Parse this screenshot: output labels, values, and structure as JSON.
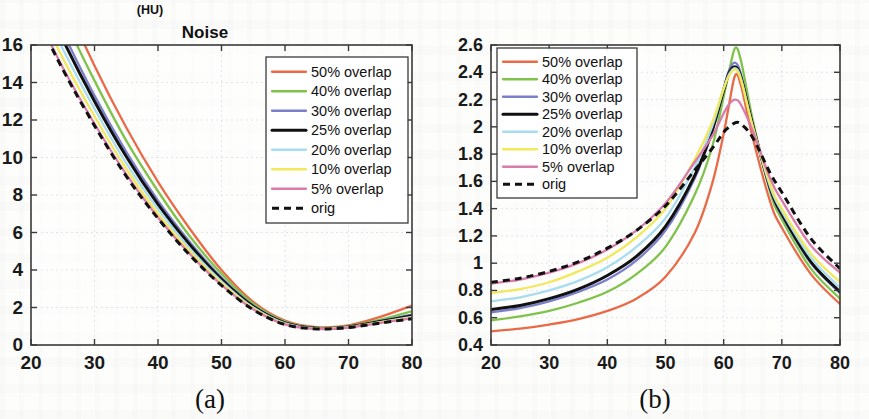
{
  "figure": {
    "unit_label": "(HU)",
    "title": "Noise",
    "caption_a": "(a)",
    "caption_b": "(b)"
  },
  "legend": {
    "entries": [
      {
        "label": "50% overlap",
        "color": "#ea6a47",
        "style": "solid"
      },
      {
        "label": "40% overlap",
        "color": "#7fc34a",
        "style": "solid"
      },
      {
        "label": "30% overlap",
        "color": "#7b7fcb",
        "style": "solid"
      },
      {
        "label": "25% overlap",
        "color": "#111111",
        "style": "solid-thick"
      },
      {
        "label": "20% overlap",
        "color": "#a8dcee",
        "style": "solid"
      },
      {
        "label": "10% overlap",
        "color": "#f2e85c",
        "style": "solid"
      },
      {
        "label": "5% overlap",
        "color": "#d97bab",
        "style": "solid"
      },
      {
        "label": "orig",
        "color": "#111111",
        "style": "dashed"
      }
    ]
  },
  "chart_data": [
    {
      "id": "a",
      "type": "line",
      "title": "Noise",
      "subtitle": "(HU)",
      "caption": "(a)",
      "xlabel": "",
      "ylabel": "(HU)",
      "xlim": [
        20,
        80
      ],
      "ylim": [
        0,
        16
      ],
      "xticks": [
        20,
        30,
        40,
        50,
        60,
        70,
        80
      ],
      "yticks": [
        0,
        2,
        4,
        6,
        8,
        10,
        12,
        14,
        16
      ],
      "xtick_labels": [
        "20",
        "30",
        "40",
        "50",
        "60",
        "70",
        "80"
      ],
      "ytick_labels": [
        "0",
        "2",
        "4",
        "6",
        "8",
        "10",
        "12",
        "14",
        "16"
      ],
      "grid": true,
      "legend_position": "upper-right",
      "x": [
        20,
        25,
        30,
        35,
        40,
        45,
        50,
        55,
        60,
        65,
        70,
        75,
        80
      ],
      "series": [
        {
          "name": "50% overlap",
          "color": "#ea6a47",
          "style": "solid",
          "values": [
            22.6,
            18.6,
            14.9,
            11.6,
            8.7,
            6.2,
            4.0,
            2.3,
            1.3,
            0.95,
            1.05,
            1.5,
            2.1
          ]
        },
        {
          "name": "40% overlap",
          "color": "#7fc34a",
          "style": "solid",
          "values": [
            21.5,
            17.6,
            14.1,
            10.9,
            8.2,
            5.8,
            3.8,
            2.2,
            1.25,
            0.92,
            1.0,
            1.35,
            1.8
          ]
        },
        {
          "name": "30% overlap",
          "color": "#7b7fcb",
          "style": "solid",
          "values": [
            20.4,
            16.7,
            13.3,
            10.3,
            7.7,
            5.5,
            3.6,
            2.1,
            1.2,
            0.9,
            0.98,
            1.28,
            1.62
          ]
        },
        {
          "name": "25% overlap",
          "color": "#111111",
          "style": "solid-thick",
          "values": [
            20.0,
            16.3,
            13.0,
            10.05,
            7.5,
            5.35,
            3.5,
            2.05,
            1.18,
            0.89,
            0.96,
            1.25,
            1.56
          ]
        },
        {
          "name": "20% overlap",
          "color": "#a8dcee",
          "style": "solid",
          "values": [
            19.4,
            15.8,
            12.6,
            9.7,
            7.25,
            5.15,
            3.4,
            2.0,
            1.15,
            0.88,
            0.95,
            1.22,
            1.5
          ]
        },
        {
          "name": "10% overlap",
          "color": "#f2e85c",
          "style": "solid",
          "values": [
            18.8,
            15.3,
            12.2,
            9.4,
            7.0,
            5.0,
            3.3,
            1.95,
            1.12,
            0.87,
            0.94,
            1.2,
            1.46
          ]
        },
        {
          "name": "5% overlap",
          "color": "#d97bab",
          "style": "solid",
          "values": [
            18.2,
            14.8,
            11.8,
            9.1,
            6.8,
            4.85,
            3.2,
            1.9,
            1.1,
            0.86,
            0.93,
            1.18,
            1.42
          ]
        },
        {
          "name": "orig",
          "color": "#111111",
          "style": "dashed",
          "values": [
            18.1,
            14.7,
            11.7,
            9.0,
            6.75,
            4.8,
            3.18,
            1.88,
            1.09,
            0.86,
            0.93,
            1.17,
            1.4
          ]
        }
      ]
    },
    {
      "id": "b",
      "type": "line",
      "caption": "(b)",
      "xlabel": "",
      "ylabel": "",
      "xlim": [
        20,
        80
      ],
      "ylim": [
        0.4,
        2.6
      ],
      "xticks": [
        20,
        30,
        40,
        50,
        60,
        70,
        80
      ],
      "yticks": [
        0.4,
        0.6,
        0.8,
        1,
        1.2,
        1.4,
        1.6,
        1.8,
        2,
        2.2,
        2.4,
        2.6
      ],
      "xtick_labels": [
        "20",
        "30",
        "40",
        "50",
        "60",
        "70",
        "80"
      ],
      "ytick_labels": [
        "0.4",
        "0.6",
        "0.8",
        "1",
        "1.2",
        "1.4",
        "1.6",
        "1.8",
        "2",
        "2.2",
        "2.4",
        "2.6"
      ],
      "grid": true,
      "legend_position": "upper-left",
      "x": [
        20,
        25,
        30,
        35,
        40,
        45,
        50,
        55,
        58,
        60,
        61,
        62,
        63,
        65,
        68,
        70,
        75,
        80
      ],
      "series": [
        {
          "name": "50% overlap",
          "color": "#ea6a47",
          "style": "solid",
          "values": [
            0.5,
            0.52,
            0.55,
            0.59,
            0.65,
            0.74,
            0.9,
            1.22,
            1.58,
            1.95,
            2.18,
            2.38,
            2.3,
            1.92,
            1.45,
            1.26,
            0.92,
            0.7
          ]
        },
        {
          "name": "40% overlap",
          "color": "#7fc34a",
          "style": "solid",
          "values": [
            0.58,
            0.61,
            0.65,
            0.71,
            0.79,
            0.92,
            1.12,
            1.5,
            1.85,
            2.22,
            2.42,
            2.58,
            2.48,
            2.05,
            1.52,
            1.32,
            0.96,
            0.74
          ]
        },
        {
          "name": "30% overlap",
          "color": "#7b7fcb",
          "style": "solid",
          "values": [
            0.64,
            0.67,
            0.72,
            0.79,
            0.88,
            1.02,
            1.24,
            1.62,
            1.96,
            2.28,
            2.42,
            2.47,
            2.38,
            2.02,
            1.54,
            1.35,
            1.0,
            0.78
          ]
        },
        {
          "name": "25% overlap",
          "color": "#111111",
          "style": "solid-thick",
          "values": [
            0.66,
            0.69,
            0.74,
            0.81,
            0.91,
            1.05,
            1.27,
            1.64,
            1.97,
            2.27,
            2.4,
            2.44,
            2.36,
            2.01,
            1.55,
            1.36,
            1.01,
            0.79
          ]
        },
        {
          "name": "20% overlap",
          "color": "#a8dcee",
          "style": "solid",
          "values": [
            0.72,
            0.75,
            0.8,
            0.87,
            0.97,
            1.12,
            1.33,
            1.7,
            2.0,
            2.28,
            2.39,
            2.43,
            2.35,
            2.0,
            1.56,
            1.38,
            1.04,
            0.82
          ]
        },
        {
          "name": "10% overlap",
          "color": "#f2e85c",
          "style": "solid",
          "values": [
            0.78,
            0.81,
            0.86,
            0.94,
            1.04,
            1.19,
            1.4,
            1.76,
            2.03,
            2.28,
            2.38,
            2.42,
            2.34,
            2.0,
            1.58,
            1.4,
            1.07,
            0.86
          ]
        },
        {
          "name": "5% overlap",
          "color": "#d97bab",
          "style": "solid",
          "values": [
            0.85,
            0.88,
            0.93,
            1.0,
            1.1,
            1.24,
            1.44,
            1.74,
            1.93,
            2.1,
            2.17,
            2.2,
            2.16,
            1.97,
            1.62,
            1.46,
            1.13,
            0.93
          ]
        },
        {
          "name": "orig",
          "color": "#111111",
          "style": "dashed",
          "values": [
            0.86,
            0.89,
            0.94,
            1.01,
            1.11,
            1.24,
            1.42,
            1.68,
            1.84,
            1.96,
            2.0,
            2.03,
            2.02,
            1.92,
            1.66,
            1.52,
            1.18,
            0.96
          ]
        }
      ]
    }
  ]
}
